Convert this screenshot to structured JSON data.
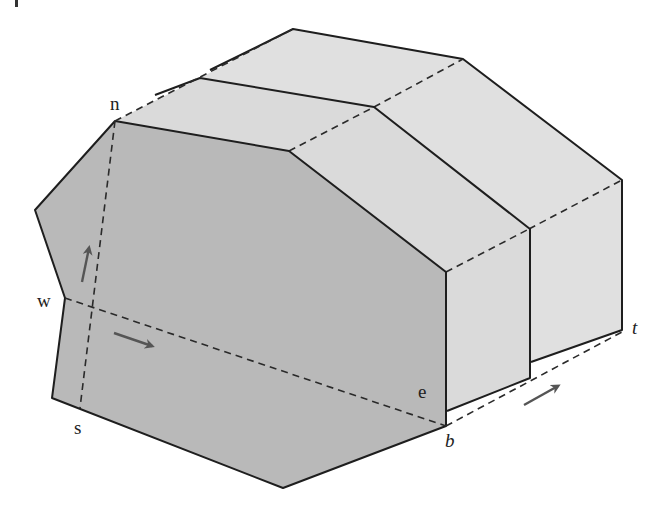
{
  "figure": {
    "colors": {
      "front_face": "#b9b9b9",
      "side_faces": "#dadada",
      "back_faces": "#e0e0e0",
      "edge": "#1e1e1e",
      "arrow": "#555555"
    },
    "labels": {
      "n": "n",
      "w": "w",
      "s": "s",
      "e": "e",
      "b": "b",
      "t": "t"
    },
    "arrows": [
      {
        "name": "up-arrow",
        "direction": "north"
      },
      {
        "name": "right-arrow",
        "direction": "east"
      },
      {
        "name": "depth-arrow",
        "direction": "toward t"
      }
    ],
    "corner_mark": "|"
  }
}
